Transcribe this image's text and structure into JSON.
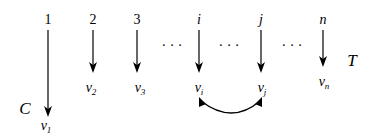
{
  "diagram": {
    "columns": [
      {
        "index_label": "1",
        "value_label": "v",
        "value_sub": "1",
        "x": 48
      },
      {
        "index_label": "2",
        "value_label": "v",
        "value_sub": "2",
        "x": 93
      },
      {
        "index_label": "3",
        "value_label": "v",
        "value_sub": "3",
        "x": 137
      },
      {
        "index_label": "i",
        "value_label": "v",
        "value_sub": "i",
        "x": 199
      },
      {
        "index_label": "j",
        "value_label": "v",
        "value_sub": "j",
        "x": 261
      },
      {
        "index_label": "n",
        "value_label": "v",
        "value_sub": "n",
        "x": 323
      }
    ],
    "ellipsis": [
      "· · ·",
      "· · ·",
      "· · ·"
    ],
    "side_label_left": "C",
    "side_label_right": "T",
    "swap_arrow": {
      "from": "v_i",
      "to": "v_j",
      "style": "double-headed curved"
    }
  }
}
